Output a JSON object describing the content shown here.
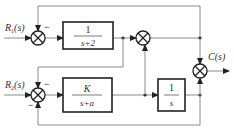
{
  "diagram": {
    "type": "block-diagram",
    "inputs": [
      {
        "id": "R1",
        "label": "R",
        "sub": "1",
        "arg": "(s)"
      },
      {
        "id": "R2",
        "label": "R",
        "sub": "2",
        "arg": "(s)"
      }
    ],
    "output": {
      "id": "C",
      "label": "C(s)"
    },
    "blocks": [
      {
        "id": "G1",
        "numerator": "1",
        "denominator": "s+2"
      },
      {
        "id": "G2",
        "numerator": "K",
        "denominator": "s+a"
      },
      {
        "id": "G3",
        "numerator": "1",
        "denominator": "s"
      }
    ],
    "summing_junctions": [
      {
        "id": "S1",
        "inputs": [
          "R1 (+)",
          "C feedback (−)"
        ]
      },
      {
        "id": "S2",
        "inputs": [
          "G1 out (+)",
          "G2 out (+)"
        ]
      },
      {
        "id": "S3",
        "inputs": [
          "S2 out (+)",
          "G3 out (+)"
        ]
      },
      {
        "id": "S4",
        "inputs": [
          "R2 (+)",
          "G1 out (−)",
          "G3 out (−)"
        ]
      }
    ],
    "signs": {
      "minus": "−"
    }
  }
}
